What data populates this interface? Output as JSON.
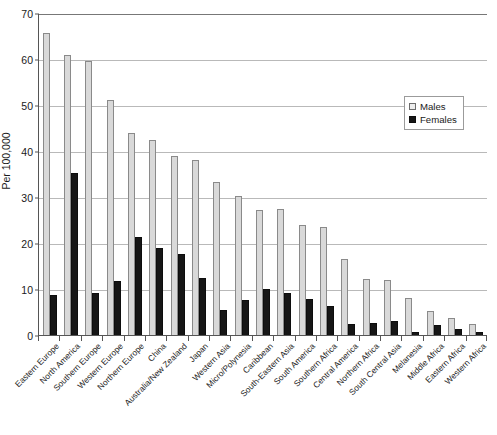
{
  "chart_data": {
    "type": "bar",
    "title": "",
    "xlabel": "",
    "ylabel": "Per 100,000",
    "ylim": [
      0,
      70
    ],
    "yticks": [
      0,
      10,
      20,
      30,
      40,
      50,
      60,
      70
    ],
    "grid": true,
    "legend_position": "top-right",
    "categories": [
      "Eastern Europe",
      "North America",
      "Southern Europe",
      "Western Europe",
      "Northern Europe",
      "China",
      "Australia/New Zealand",
      "Japan",
      "Western Asia",
      "Micro/Polynesia",
      "Caribbean",
      "South-Eastern Asia",
      "South America",
      "Southern Africa",
      "Central America",
      "Northern Africa",
      "South Central Asia",
      "Melanesia",
      "Middle Africa",
      "Eastern Africa",
      "Western Africa"
    ],
    "series": [
      {
        "name": "Males",
        "color": "#d9d9d9",
        "values": [
          65.7,
          60.9,
          59.6,
          51.0,
          44.0,
          42.4,
          39.0,
          38.1,
          33.2,
          30.2,
          27.2,
          27.3,
          23.9,
          23.5,
          16.5,
          12.2,
          12.0,
          8.0,
          5.2,
          3.8,
          2.3
        ]
      },
      {
        "name": "Females",
        "color": "#161616",
        "values": [
          8.7,
          35.2,
          9.2,
          11.8,
          21.4,
          18.9,
          17.6,
          12.3,
          5.4,
          7.6,
          9.9,
          9.1,
          7.9,
          6.4,
          2.4,
          2.6,
          3.1,
          0.6,
          2.1,
          1.2,
          0.7
        ]
      }
    ]
  },
  "legend": {
    "items": [
      {
        "label": "Males",
        "swatch": "male-swatch"
      },
      {
        "label": "Females",
        "swatch": "female-swatch"
      }
    ]
  }
}
